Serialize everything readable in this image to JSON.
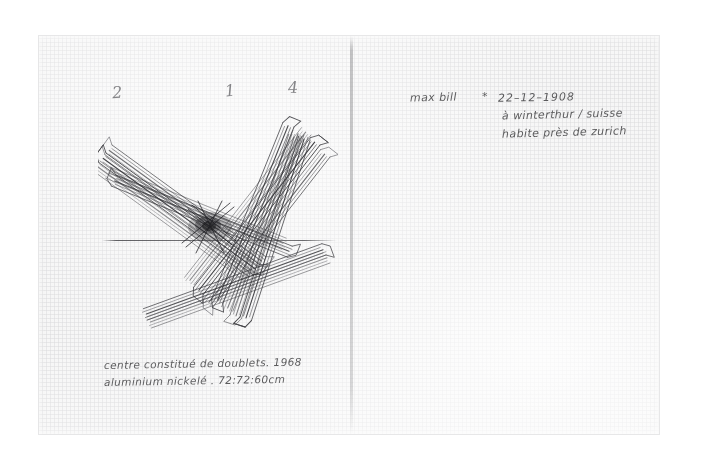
{
  "artwork": {
    "medium_note": "pencil sketch on gridded notebook paper",
    "numerals": [
      {
        "label": "2"
      },
      {
        "label": "1"
      },
      {
        "label": "4"
      }
    ]
  },
  "notes": {
    "artist_name": "max bill",
    "birth_marker": "*",
    "birth_date": "22–12–1908",
    "birth_place": "à winterthur / suisse",
    "residence": "habite près de zurich"
  },
  "caption": {
    "line1": "centre constitué de doublets.  1968",
    "line2": "aluminium nickelé .  72:72:60cm"
  },
  "colors": {
    "paper": "#f3f3f3",
    "grid": "#cdcdd0",
    "pencil": "#3a3a3c",
    "backdrop": "#ffffff"
  }
}
